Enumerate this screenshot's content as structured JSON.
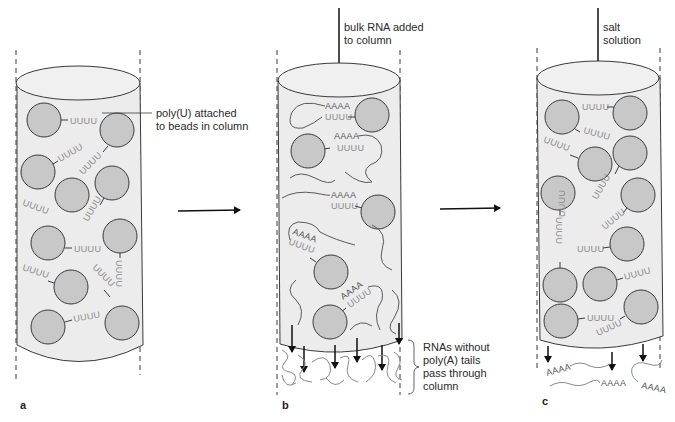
{
  "figure": {
    "panels": [
      {
        "id": "a",
        "label": "a",
        "annotation": [
          "poly(U) attached",
          "to beads in column"
        ],
        "sequence": "UUUU"
      },
      {
        "id": "b",
        "label": "b",
        "top_annotation": [
          "bulk RNA added",
          "to column"
        ],
        "bottom_annotation": [
          "RNAs without",
          "poly(A) tails",
          "pass through",
          "column"
        ],
        "bound_sequence": "AAAA",
        "bead_sequence": "UUUU"
      },
      {
        "id": "c",
        "label": "c",
        "top_annotation": [
          "salt",
          "solution"
        ],
        "eluted_sequence": "AAAA",
        "bead_sequence": "UUUU"
      }
    ],
    "arrows": [
      "a-to-b",
      "b-to-c"
    ],
    "colors": {
      "bead_fill": "#c8c8c8",
      "column_fill": "#ececec",
      "outline": "#3a3a3a",
      "uuuu_text": "#8a8a8a",
      "aaaa_text": "#555555"
    }
  }
}
